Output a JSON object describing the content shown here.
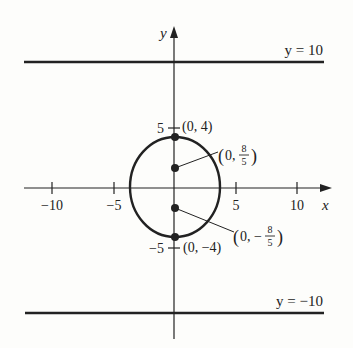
{
  "diagram": {
    "type": "coordinate-plot",
    "axes": {
      "x_label": "x",
      "y_label": "y",
      "x_ticks": [
        {
          "value": -10,
          "label": "−10"
        },
        {
          "value": -5,
          "label": "−5"
        },
        {
          "value": 5,
          "label": "5"
        },
        {
          "value": 10,
          "label": "10"
        }
      ],
      "y_ticks": [
        {
          "value": 5,
          "label": "5"
        },
        {
          "value": -5,
          "label": "−5"
        }
      ]
    },
    "lines": [
      {
        "equation": "y = 10",
        "label": "y = 10"
      },
      {
        "equation": "y = −10",
        "label": "y = −10"
      }
    ],
    "ellipse": {
      "center": [
        0,
        0
      ],
      "vertices": [
        {
          "point": "(0, 4)",
          "label": "(0, 4)"
        },
        {
          "point": "(0, -4)",
          "label": "(0, −4)"
        }
      ],
      "foci": [
        {
          "point": "(0, 8/5)",
          "label_prefix": "(0, ",
          "num": "8",
          "den": "5",
          "label_suffix": ")"
        },
        {
          "point": "(0, -8/5)",
          "label_prefix": "(0, −",
          "num": "8",
          "den": "5",
          "label_suffix": ")"
        }
      ]
    }
  },
  "colors": {
    "ink": "#222222",
    "background": "#fdfdfb"
  }
}
